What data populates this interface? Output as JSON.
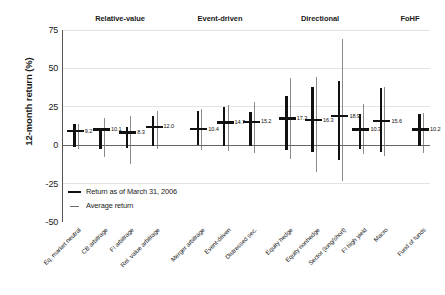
{
  "chart_data": {
    "type": "bar",
    "title": "",
    "subtitle": "",
    "xlabel": "",
    "ylabel": "12-month return (%)",
    "ylim": [
      -50,
      75
    ],
    "yticks": [
      "75",
      "50",
      "25",
      "0",
      "-25",
      "-50"
    ],
    "ytick_values": [
      75,
      50,
      25,
      0,
      -25,
      -50
    ],
    "grid": true,
    "grid_axis": "y",
    "legend_position": "inside-lower-left",
    "zero_line": true,
    "groups": [
      {
        "label": "Relative-value",
        "start_index": 0,
        "end_index": 3
      },
      {
        "label": "Event-driven",
        "start_index": 4,
        "end_index": 6
      },
      {
        "label": "Directional",
        "start_index": 7,
        "end_index": 11
      },
      {
        "label": "FoHF",
        "start_index": 12,
        "end_index": 12
      }
    ],
    "categories": [
      "Eq. market neutral",
      "CB arbitrage",
      "FI arbitrage",
      "Rel. value arbitrage",
      "Merger arbitrage",
      "Event-driven",
      "Distressed sec.",
      "Equity hedge",
      "Equity nonhedge",
      "Sector (long/short)",
      "FI high yield",
      "Macro",
      "Fund of funds"
    ],
    "series": [
      {
        "name": "Return as of March 31, 2006",
        "type": "thick-bar-range",
        "values": [
          {
            "low": -1.0,
            "high": 13.5
          },
          {
            "low": -2.5,
            "high": 11.5
          },
          {
            "low": -2.0,
            "high": 12.0
          },
          {
            "low": -0.5,
            "high": 19.0
          },
          {
            "low": 0.0,
            "high": 22.5
          },
          {
            "low": -0.5,
            "high": 25.0
          },
          {
            "low": -0.5,
            "high": 21.5
          },
          {
            "low": -3.0,
            "high": 32.0
          },
          {
            "low": -4.5,
            "high": 38.0
          },
          {
            "low": -9.5,
            "high": 41.5
          },
          {
            "low": -2.5,
            "high": 20.5
          },
          {
            "low": -4.5,
            "high": 37.0
          },
          {
            "low": -0.5,
            "high": 20.5
          }
        ]
      },
      {
        "name": "Average return",
        "type": "thin-line-range-with-marker",
        "values": [
          {
            "low": -2.5,
            "high": 14.0,
            "marker": 9.2
          },
          {
            "low": -7.5,
            "high": 18.0,
            "marker": 10.1
          },
          {
            "low": -12.5,
            "high": 19.0,
            "marker": 8.3
          },
          {
            "low": -2.5,
            "high": 22.0,
            "marker": 12.0
          },
          {
            "low": -3.0,
            "high": 23.5,
            "marker": 10.4
          },
          {
            "low": -4.0,
            "high": 26.0,
            "marker": 14.7
          },
          {
            "low": -5.0,
            "high": 28.0,
            "marker": 15.2
          },
          {
            "low": -9.0,
            "high": 43.5,
            "marker": 17.3
          },
          {
            "low": -17.5,
            "high": 44.5,
            "marker": 16.3
          },
          {
            "low": -23.5,
            "high": 69.0,
            "marker": 18.9
          },
          {
            "low": -6.0,
            "high": 27.0,
            "marker": 10.3
          },
          {
            "low": -7.0,
            "high": 38.0,
            "marker": 15.6
          },
          {
            "low": -5.0,
            "high": 21.0,
            "marker": 10.2
          }
        ]
      }
    ],
    "marker_labels": [
      "9.2",
      "10.1",
      "8.3",
      "12.0",
      "10.4",
      "14.7",
      "15.2",
      "17.3",
      "16.3",
      "18.9",
      "10.3",
      "15.6",
      "10.2"
    ],
    "legend": [
      {
        "label": "Return as of March 31, 2006",
        "style": "thick",
        "color": "#111111"
      },
      {
        "label": "Average return",
        "style": "thin",
        "color": "#6e6e6e"
      }
    ],
    "colors": {
      "return_bar": "#111111",
      "average_line": "#6e6e6e",
      "axis": "#555555",
      "grid": "#e3e3e3",
      "zero_line": "#666666",
      "text": "#1a1a1a",
      "background": "#ffffff"
    }
  }
}
